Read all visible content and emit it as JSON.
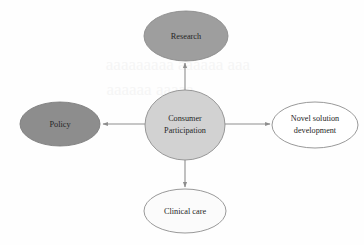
{
  "diagram": {
    "type": "radial-hub-and-spoke",
    "background_color": "#fefefe",
    "hub": {
      "id": "consumer-participation",
      "label_line1": "Consumer",
      "label_line2": "Participation",
      "shape": "circle",
      "fill_color": "#d2d2d2",
      "stroke_color": "#8d8d8d",
      "cx": 185,
      "cy": 125,
      "rx": 40,
      "ry": 35
    },
    "nodes": [
      {
        "id": "research",
        "label": "Research",
        "shape": "ellipse",
        "position": "top",
        "fill_color": "#9e9e9e",
        "stroke_color": "#8a8a8a",
        "cx": 186,
        "cy": 36,
        "rx": 42,
        "ry": 25
      },
      {
        "id": "policy",
        "label": "Policy",
        "shape": "ellipse",
        "position": "left",
        "fill_color": "#8d8d8d",
        "stroke_color": "#7d7d7d",
        "cx": 60,
        "cy": 124,
        "rx": 40,
        "ry": 22
      },
      {
        "id": "novel-solution-development",
        "label_line1": "Novel solution",
        "label_line2": "development",
        "shape": "ellipse",
        "position": "right",
        "fill_color": "#ffffff",
        "stroke_color": "#8d8d8d",
        "cx": 315,
        "cy": 125,
        "rx": 43,
        "ry": 23
      },
      {
        "id": "clinical-care",
        "label": "Clinical care",
        "shape": "ellipse",
        "position": "bottom",
        "fill_color": "#fbfbfb",
        "stroke_color": "#8d8d8d",
        "cx": 185,
        "cy": 211,
        "rx": 41,
        "ry": 22
      }
    ],
    "arrows": [
      {
        "id": "arrow-to-research",
        "from": "consumer-participation",
        "to": "research",
        "direction": "up",
        "color": "#8d8d8d"
      },
      {
        "id": "arrow-to-policy",
        "from": "consumer-participation",
        "to": "policy",
        "direction": "left",
        "color": "#8d8d8d"
      },
      {
        "id": "arrow-to-novel",
        "from": "consumer-participation",
        "to": "novel-solution-development",
        "direction": "right",
        "color": "#8d8d8d"
      },
      {
        "id": "arrow-to-clinical",
        "from": "consumer-participation",
        "to": "clinical-care",
        "direction": "down",
        "color": "#8d8d8d"
      }
    ]
  }
}
